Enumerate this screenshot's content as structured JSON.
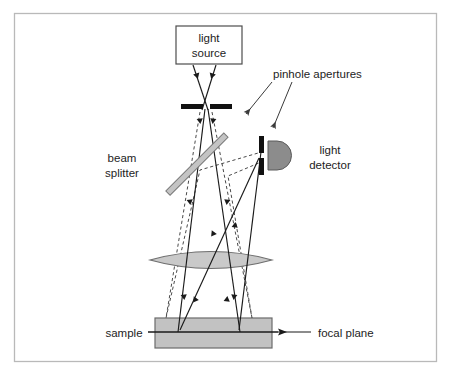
{
  "figure": {
    "border": {
      "x": 14,
      "y": 13,
      "width": 423,
      "height": 349,
      "color": "#b9b9b9"
    },
    "background": "#ffffff"
  },
  "colors": {
    "ray_solid": "#1a1a1a",
    "ray_dashed": "#4a4a4a",
    "aperture_bar": "#111111",
    "lens_fill": "#c9c9c9",
    "lens_stroke": "#6e6e6e",
    "beamsplitter_fill": "#c4c4c4",
    "beamsplitter_stroke": "#7a7a7a",
    "detector_fill": "#8c8c8c",
    "detector_stroke": "#5a5a5a",
    "sample_fill": "#c2c2c2",
    "sample_stroke": "#6b6b6b",
    "focal_plane_line": "#1a1a1a",
    "box_stroke": "#4d4d4d",
    "text": "#1d1d1d"
  },
  "labels": {
    "light_source": {
      "line1": "light",
      "line2": "source",
      "x": 209,
      "y": 40
    },
    "pinhole_apertures": {
      "text": "pinhole apertures",
      "x": 273,
      "y": 74
    },
    "beam_splitter": {
      "line1": "beam",
      "line2": "splitter",
      "x": 122,
      "y": 160
    },
    "light_detector": {
      "line1": "light",
      "line2": "detector",
      "x": 330,
      "y": 152
    },
    "sample": {
      "text": "sample",
      "x": 124,
      "y": 336
    },
    "focal_plane": {
      "text": "focal plane",
      "x": 318,
      "y": 336
    }
  },
  "components": {
    "light_source_box": {
      "x": 176,
      "y": 26,
      "width": 66,
      "height": 38
    },
    "pinhole_top_left_bar": {
      "x": 181,
      "y": 104,
      "width": 22,
      "height": 5
    },
    "pinhole_top_right_bar": {
      "x": 209,
      "y": 104,
      "width": 22,
      "height": 5
    },
    "pinhole_detector_upper_bar": {
      "x": 259,
      "y": 137,
      "width": 5,
      "height": 16
    },
    "pinhole_detector_lower_bar": {
      "x": 259,
      "y": 158,
      "width": 5,
      "height": 16
    },
    "beam_splitter_bar": {
      "x1": 176,
      "y1": 186,
      "x2": 233,
      "y2": 128,
      "thickness": 5
    },
    "detector": {
      "cx": 276,
      "cy": 155,
      "radius": 15
    },
    "objective_lens": {
      "cx": 211,
      "cy": 260,
      "rx": 61,
      "ry": 13
    },
    "sample_slab": {
      "x": 155,
      "y": 318,
      "width": 117,
      "height": 30
    },
    "focal_plane_line": {
      "x1": 148,
      "y1": 332,
      "x2": 278,
      "y2": 332
    }
  },
  "annotations": {
    "pinhole_leader_1": {
      "x1": 271,
      "y1": 82,
      "x2": 245,
      "y2": 114
    },
    "pinhole_leader_2": {
      "x1": 290,
      "y1": 82,
      "x2": 272,
      "y2": 128
    },
    "focal_plane_arrow": {
      "x1": 311,
      "y1": 332,
      "x2": 277,
      "y2": 332
    }
  },
  "ray_paths": {
    "illumination_solid": [
      "M 193 66 L 207 110",
      "M 215 66 L 203 110"
    ],
    "excitation_solid": [
      "M 205 110 L 179 332",
      "M 208 110 L 238 332"
    ],
    "return_solid": [
      "M 238 332 L 262 155",
      "M 179 332 L 258 157"
    ],
    "emission_dashed": [
      "M 199 113 L 167 320",
      "M 213 113 L 251 320",
      "M 167 320 L 264 152",
      "M 251 320 L 266 158"
    ],
    "arrow_marker_positions": [
      {
        "x": 196,
        "y": 82,
        "dir": "down"
      },
      {
        "x": 212,
        "y": 82,
        "dir": "down"
      },
      {
        "x": 199,
        "y": 122,
        "dir": "down"
      },
      {
        "x": 213,
        "y": 122,
        "dir": "down"
      },
      {
        "x": 188,
        "y": 200,
        "dir": "down"
      },
      {
        "x": 229,
        "y": 200,
        "dir": "down"
      },
      {
        "x": 184,
        "y": 300,
        "dir": "down"
      },
      {
        "x": 233,
        "y": 300,
        "dir": "down"
      },
      {
        "x": 194,
        "y": 300,
        "dir": "up"
      },
      {
        "x": 224,
        "y": 300,
        "dir": "up"
      },
      {
        "x": 197,
        "y": 218,
        "dir": "up"
      },
      {
        "x": 222,
        "y": 218,
        "dir": "up"
      }
    ]
  }
}
